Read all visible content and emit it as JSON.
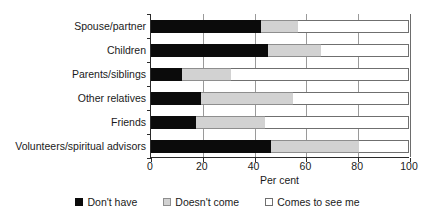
{
  "chart_data": {
    "type": "bar",
    "orientation": "horizontal",
    "stacked": true,
    "title": "",
    "xlabel": "Per cent",
    "ylabel": "",
    "xlim": [
      0,
      100
    ],
    "xticks": [
      0,
      20,
      40,
      60,
      80,
      100
    ],
    "xtick_labels": [
      "0",
      "20",
      "40",
      "60",
      "80",
      "100"
    ],
    "grid": "vertical",
    "legend_position": "bottom",
    "categories": [
      "Spouse/partner",
      "Children",
      "Parents/siblings",
      "Other relatives",
      "Friends",
      "Volunteers/spiritual advisors"
    ],
    "series": [
      {
        "name": "Don't have",
        "color": "#0b0b0b",
        "values": [
          42.5,
          45.5,
          12,
          19.5,
          17.5,
          46.5
        ]
      },
      {
        "name": "Doesn't come",
        "color": "#d2d2d2",
        "values": [
          14.5,
          20.5,
          19,
          35.5,
          26.5,
          34
        ]
      },
      {
        "name": "Comes to see me",
        "color": "#ffffff",
        "values": [
          43,
          34,
          69,
          45,
          56,
          19.5
        ]
      }
    ],
    "cumulative_boundaries": [
      [
        42.5,
        57
      ],
      [
        45.5,
        66
      ],
      [
        12,
        31
      ],
      [
        19.5,
        55
      ],
      [
        17.5,
        44
      ],
      [
        46.5,
        80.5
      ]
    ]
  },
  "legend": {
    "items": [
      {
        "label": "Don't have",
        "swatch": "black-filled-square"
      },
      {
        "label": "Doesn't come",
        "swatch": "gray-filled-square"
      },
      {
        "label": "Comes to see me",
        "swatch": "white-empty-square"
      }
    ]
  }
}
